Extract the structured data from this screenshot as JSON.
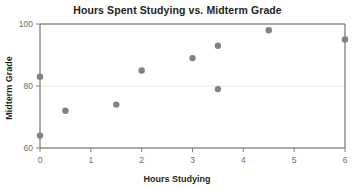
{
  "chart_data": {
    "type": "scatter",
    "title": "Hours Spent Studying vs. Midterm Grade",
    "xlabel": "Hours Studying",
    "ylabel": "Midterm Grade",
    "xlim": [
      0,
      6
    ],
    "ylim": [
      60,
      100
    ],
    "xticks": [
      0,
      1,
      2,
      3,
      4,
      5,
      6
    ],
    "yticks": [
      60,
      80,
      100
    ],
    "xtick_labels": [
      "0",
      "1",
      "2",
      "3",
      "4",
      "5",
      "6"
    ],
    "ytick_labels": [
      "60",
      "80",
      "100"
    ],
    "grid": true,
    "legend": false,
    "point_color": "#808285",
    "points": [
      {
        "x": 0,
        "y": 83
      },
      {
        "x": 0,
        "y": 64
      },
      {
        "x": 0.5,
        "y": 72
      },
      {
        "x": 1.5,
        "y": 74
      },
      {
        "x": 2,
        "y": 85
      },
      {
        "x": 3,
        "y": 89
      },
      {
        "x": 3.5,
        "y": 93
      },
      {
        "x": 3.5,
        "y": 79
      },
      {
        "x": 4.5,
        "y": 98
      },
      {
        "x": 6,
        "y": 95
      }
    ]
  }
}
